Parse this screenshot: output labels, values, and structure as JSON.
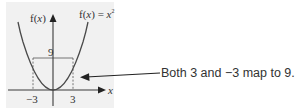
{
  "diagram": {
    "function_label_prefix": "f(",
    "function_label_var": "x",
    "function_label_suffix": ") = ",
    "function_label_rhs": "x",
    "function_label_exp": "2",
    "y_axis_label_prefix": "f(",
    "y_axis_label_var": "x",
    "y_axis_label_suffix": ")",
    "x_axis_label": "x",
    "y_tick_label": "9",
    "x_tick_left": "−3",
    "x_tick_right": "3",
    "callout_text": "Both 3 and −3 map to 9."
  },
  "colors": {
    "panel_background": "#f1f1f1",
    "curve": "#4a4a4a",
    "axis": "#3a3a3a",
    "text": "#333333"
  }
}
